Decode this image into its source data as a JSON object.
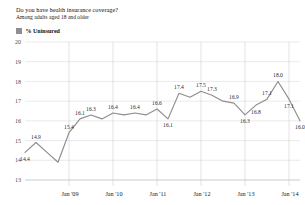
{
  "header": {
    "title": "Do you have health insurance coverage?",
    "subtitle": "Among adults aged 18 and older"
  },
  "legend": {
    "label": "% Uninsured",
    "swatch_color": "#8e8e8e"
  },
  "chart_data": {
    "type": "line",
    "title": "Do you have health insurance coverage?",
    "subtitle": "Among adults aged 18 and older",
    "xlabel": "",
    "ylabel": "",
    "ylim": [
      13,
      20
    ],
    "yticks": [
      13,
      14,
      15,
      16,
      17,
      18,
      19,
      20
    ],
    "ytick_labels": [
      "13",
      "14",
      "15",
      "16",
      "17",
      "18",
      "19",
      "20"
    ],
    "xtick_labels": [
      "Jan '09",
      "Jan '10",
      "Jan '11",
      "Jan '12",
      "Jan '13",
      "Jan '14"
    ],
    "xtick_indices": [
      4,
      8,
      12,
      16,
      20,
      24
    ],
    "grid": "horizontal-and-year-dividers",
    "legend_position": "above-plot-left",
    "line_color": "#8e8e8e",
    "series": [
      {
        "name": "% Uninsured",
        "x": [
          "Q1 '08",
          "Q2 '08",
          "Q3 '08",
          "Q4 '08",
          "Q1 '09",
          "Q2 '09",
          "Q3 '09",
          "Q4 '09",
          "Q1 '10",
          "Q2 '10",
          "Q3 '10",
          "Q4 '10",
          "Q1 '11",
          "Q2 '11",
          "Q3 '11",
          "Q4 '11",
          "Q1 '12",
          "Q2 '12",
          "Q3 '12",
          "Q4 '12",
          "Q1 '13",
          "Q2 '13",
          "Q3 '13",
          "Q4 '13",
          "Q1 '14"
        ],
        "values": [
          14.4,
          14.9,
          14.4,
          13.9,
          15.4,
          16.1,
          16.3,
          16.1,
          16.4,
          16.3,
          16.4,
          16.3,
          16.6,
          16.1,
          17.4,
          17.2,
          17.5,
          17.3,
          17.0,
          16.9,
          16.3,
          16.8,
          17.1,
          18.0,
          17.1
        ],
        "point_labels": [
          "14.4",
          "14.9",
          "",
          "",
          "15.4",
          "16.1",
          "16.3",
          "",
          "16.4",
          "",
          "16.4",
          "",
          "16.6",
          "16.1",
          "17.4",
          "",
          "17.5",
          "17.3",
          "",
          "16.9",
          "16.3",
          "16.8",
          "17.1",
          "18.0",
          "17.1"
        ]
      }
    ],
    "final_point": {
      "value": 16.0,
      "label": "16.0"
    },
    "labeled_values": [
      "14.4",
      "14.9",
      "15.4",
      "16.1",
      "16.3",
      "16.4",
      "16.4",
      "16.6",
      "16.1",
      "17.4",
      "17.5",
      "17.3",
      "16.9",
      "16.3",
      "16.8",
      "17.1",
      "18.0",
      "17.1",
      "16.0"
    ]
  }
}
